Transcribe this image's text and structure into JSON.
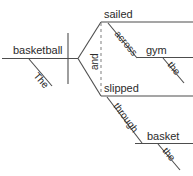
{
  "diagram": {
    "type": "reed-kellogg-sentence-diagram",
    "sentence": "The basketball sailed across the gym and slipped through the basket.",
    "colors": {
      "background": "#ffffff",
      "line": "#4d4d4d",
      "dashed_line": "#8a8a8a",
      "text": "#2b2b2b"
    },
    "subject": {
      "label": "basketball",
      "modifier": "The"
    },
    "conjunction": {
      "label": "and"
    },
    "predicates": [
      {
        "verb": "sailed",
        "preposition": "across",
        "object": "gym",
        "object_modifier": "the"
      },
      {
        "verb": "slipped",
        "preposition": "through",
        "object": "basket",
        "object_modifier": "the"
      }
    ]
  }
}
